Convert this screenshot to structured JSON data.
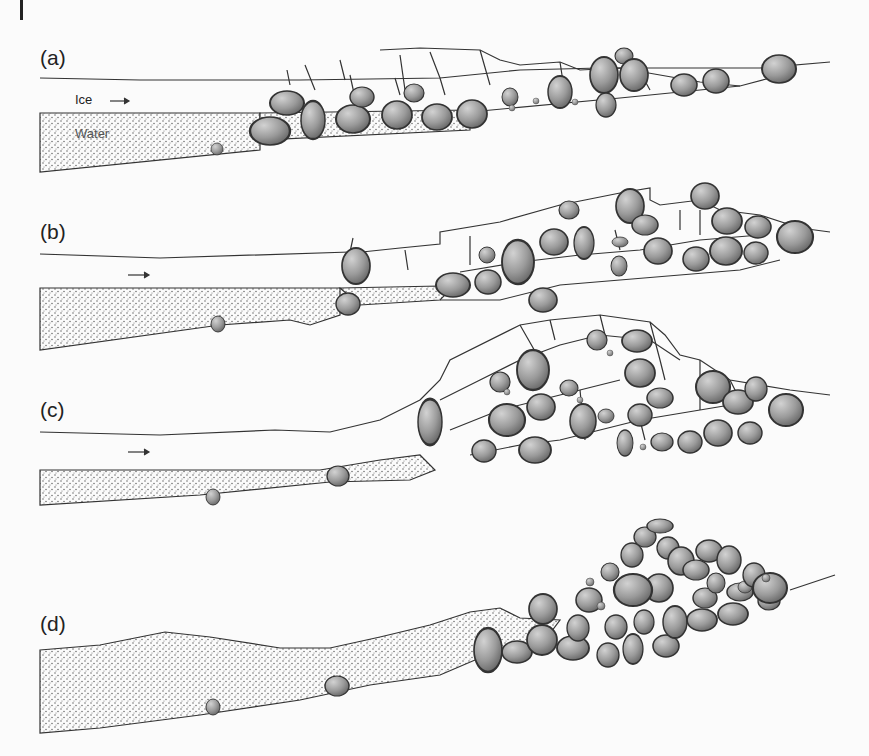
{
  "figure": {
    "colors": {
      "background": "#fbfbfb",
      "line": "#333333",
      "water_stipple": "#555555",
      "boulder_light": "#cfcfcf",
      "boulder_dark": "#6a6a6a"
    },
    "panels": [
      {
        "id": "a",
        "label": "(a)",
        "ice_label": "Ice",
        "water_label": "Water",
        "flow_arrow": "right-arrow"
      },
      {
        "id": "b",
        "label": "(b)",
        "flow_arrow": "right-arrow"
      },
      {
        "id": "c",
        "label": "(c)",
        "flow_arrow": "right-arrow"
      },
      {
        "id": "d",
        "label": "(d)"
      }
    ]
  }
}
